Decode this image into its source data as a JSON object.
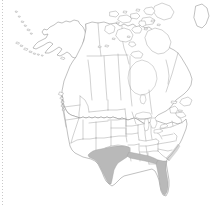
{
  "figure": {
    "kind": "distribution-map",
    "region": "North America",
    "title": "",
    "subtitle": "",
    "caption": "",
    "background_color": "#ffffff",
    "width_px": 214,
    "height_px": 205
  },
  "legend": {
    "present": false,
    "entries": []
  },
  "styles": {
    "outline_color": "#8d8d8d",
    "subdivision_color": "#9a9a9a",
    "range_fill_color": "#b9b9b9",
    "range_stroke_color": "#9c9c9c",
    "land_fill_color": "#ffffff",
    "rule_color": "#c9c9c9"
  },
  "decorations": {
    "left_rule": {
      "name": "dotted-left-rule",
      "style": "dotted",
      "orientation": "vertical",
      "x_px": 2,
      "color": "#c9c9c9"
    }
  },
  "map_content": {
    "countries": [
      {
        "name": "Canada",
        "subdivisions_drawn": true,
        "shaded": false
      },
      {
        "name": "United States",
        "subdivisions_drawn": true,
        "shaded": true
      },
      {
        "name": "Greenland",
        "subdivisions_drawn": false,
        "shaded": false
      }
    ],
    "features": [
      {
        "name": "alaska",
        "label": "Alaska",
        "shaded": false
      },
      {
        "name": "aleutian-islands",
        "label": "Aleutian Islands",
        "shaded": false
      },
      {
        "name": "arctic-archipelago",
        "label": "Canadian Arctic Archipelago",
        "shaded": false
      },
      {
        "name": "hudson-bay",
        "label": "Hudson Bay",
        "shaded": false
      },
      {
        "name": "great-lakes",
        "label": "Great Lakes",
        "shaded": false
      },
      {
        "name": "newfoundland",
        "label": "Newfoundland",
        "shaded": false
      },
      {
        "name": "baja-california",
        "label": "Baja California",
        "shaded": false
      }
    ],
    "shaded_range": {
      "description": "Shaded distribution covering the south-central and southeastern United States",
      "fill_color": "#b9b9b9",
      "areas": [
        "Texas",
        "southern New Mexico",
        "Louisiana",
        "Mississippi coast",
        "Alabama coast",
        "Florida",
        "southern Georgia coast"
      ]
    }
  },
  "labels": {
    "axis_labels": [],
    "tick_labels": [],
    "annotations": []
  }
}
